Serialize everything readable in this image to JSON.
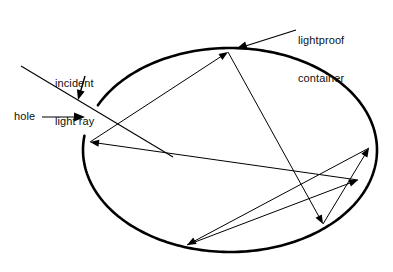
{
  "figure": {
    "type": "optics-ray-diagram",
    "background_color": "#ffffff",
    "ink_color": "#000000",
    "canvas": {
      "width": 393,
      "height": 272
    }
  },
  "labels": {
    "container": "lightproof\ncontainer",
    "container_line1": "lightproof",
    "container_line2": "container",
    "incident": "incident\nlight ray",
    "incident_line1": "incident",
    "incident_line2": "light ray",
    "hole": "hole"
  },
  "container": {
    "shape": "ellipse",
    "center_x": 230,
    "center_y": 150,
    "radius_x": 147,
    "radius_y": 102,
    "stroke_width": 2.6,
    "stroke_color": "#000000",
    "fill": "none",
    "gap_label": "hole",
    "gap_start_deg": 188,
    "gap_end_deg": 206
  },
  "hole": {
    "x": 89,
    "y": 131,
    "description": "small gap in the container wall where the incident ray enters"
  },
  "incident_ray": {
    "from_x": 21,
    "from_y": 66,
    "to_x": 173,
    "to_y": 157,
    "stroke_width": 1.1
  },
  "ray_path": {
    "stroke_width": 1.0,
    "stroke_color": "#000000",
    "arrow_size": 9,
    "points": [
      {
        "name": "entry-left",
        "x": 90,
        "y": 142
      },
      {
        "name": "top",
        "x": 228,
        "y": 52
      },
      {
        "name": "bottom-right",
        "x": 323,
        "y": 224
      },
      {
        "name": "right-upper",
        "x": 369,
        "y": 148
      },
      {
        "name": "bottom-left",
        "x": 187,
        "y": 245
      },
      {
        "name": "right-mid",
        "x": 358,
        "y": 180
      }
    ],
    "segments": [
      {
        "name": "segment-1",
        "from": "entry-left",
        "to": "top",
        "x1": 90,
        "y1": 142,
        "x2": 228,
        "y2": 52
      },
      {
        "name": "segment-2",
        "from": "top",
        "to": "bottom-right",
        "x1": 228,
        "y1": 52,
        "x2": 323,
        "y2": 224
      },
      {
        "name": "segment-3",
        "from": "bottom-right",
        "to": "right-upper",
        "x1": 323,
        "y1": 224,
        "x2": 369,
        "y2": 148
      },
      {
        "name": "segment-4",
        "from": "right-upper",
        "to": "bottom-left",
        "x1": 369,
        "y1": 148,
        "x2": 187,
        "y2": 245
      },
      {
        "name": "segment-5",
        "from": "bottom-left",
        "to": "right-mid",
        "x1": 187,
        "y1": 245,
        "x2": 358,
        "y2": 180
      },
      {
        "name": "segment-6",
        "from": "right-mid",
        "to": "entry-left",
        "x1": 358,
        "y1": 180,
        "x2": 90,
        "y2": 142
      }
    ]
  },
  "leader_lines": {
    "container": {
      "x1": 296,
      "y1": 30,
      "x2": 236,
      "y2": 49,
      "arrow": "arrow-left-down"
    },
    "incident": {
      "x1": 85,
      "y1": 76,
      "x2": 78,
      "y2": 100,
      "arrow": "arrow-down"
    },
    "hole": {
      "x1": 42,
      "y1": 117,
      "x2": 85,
      "y2": 117,
      "arrow": "arrow-right"
    }
  }
}
